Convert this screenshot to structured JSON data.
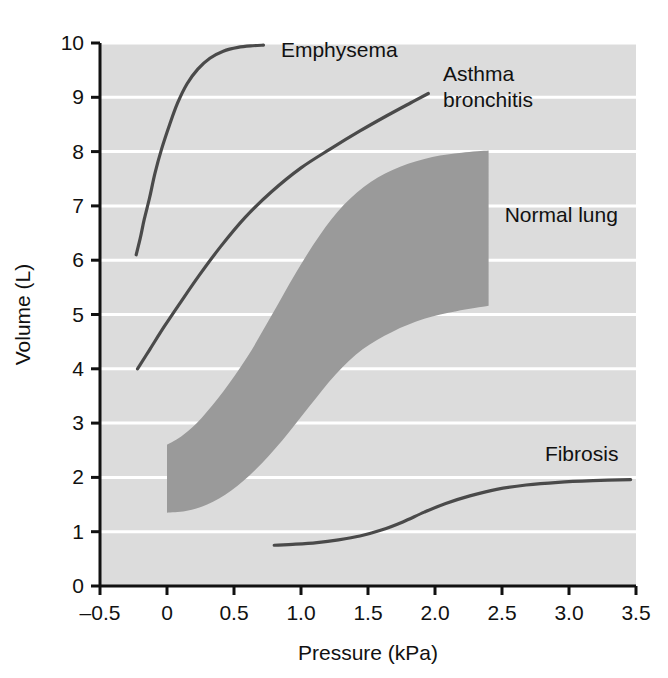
{
  "chart_data": {
    "type": "line",
    "title": "",
    "xlabel": "Pressure (kPa)",
    "ylabel": "Volume (L)",
    "xlim": [
      -0.5,
      3.5
    ],
    "ylim": [
      0,
      10
    ],
    "xticks": [
      "–0.5",
      "0",
      "0.5",
      "1.0",
      "1.5",
      "2.0",
      "2.5",
      "3.0",
      "3.5"
    ],
    "xtick_values": [
      -0.5,
      0,
      0.5,
      1.0,
      1.5,
      2.0,
      2.5,
      3.0,
      3.5
    ],
    "yticks": [
      "0",
      "1",
      "2",
      "3",
      "4",
      "5",
      "6",
      "7",
      "8",
      "9",
      "10"
    ],
    "ytick_values": [
      0,
      1,
      2,
      3,
      4,
      5,
      6,
      7,
      8,
      9,
      10
    ],
    "grid": "horizontal-white-gridlines",
    "legend": "inline-labels",
    "plot_background": "#dcdcdc",
    "gridline_color": "#ffffff",
    "curve_color": "#4a4a4a",
    "band_color": "#9a9a9a",
    "series": [
      {
        "name": "Emphysema",
        "label": "Emphysema",
        "type": "curve",
        "color": "#4a4a4a",
        "label_x": 0.85,
        "label_y": 9.75,
        "points": [
          [
            -0.23,
            6.1
          ],
          [
            -0.2,
            6.4
          ],
          [
            -0.17,
            6.75
          ],
          [
            -0.13,
            7.15
          ],
          [
            -0.09,
            7.6
          ],
          [
            -0.04,
            8.05
          ],
          [
            0.02,
            8.5
          ],
          [
            0.08,
            8.9
          ],
          [
            0.15,
            9.25
          ],
          [
            0.23,
            9.52
          ],
          [
            0.32,
            9.72
          ],
          [
            0.42,
            9.85
          ],
          [
            0.53,
            9.92
          ],
          [
            0.64,
            9.95
          ],
          [
            0.72,
            9.96
          ]
        ]
      },
      {
        "name": "Asthma bronchitis",
        "label_line1": "Asthma",
        "label_line2": "bronchitis",
        "type": "curve",
        "color": "#4a4a4a",
        "label_x": 2.06,
        "label_y": 9.3,
        "points": [
          [
            -0.22,
            4.0
          ],
          [
            -0.13,
            4.35
          ],
          [
            -0.02,
            4.78
          ],
          [
            0.1,
            5.22
          ],
          [
            0.24,
            5.72
          ],
          [
            0.4,
            6.25
          ],
          [
            0.58,
            6.78
          ],
          [
            0.78,
            7.26
          ],
          [
            1.0,
            7.7
          ],
          [
            1.22,
            8.05
          ],
          [
            1.44,
            8.38
          ],
          [
            1.64,
            8.66
          ],
          [
            1.82,
            8.9
          ],
          [
            1.95,
            9.07
          ]
        ]
      },
      {
        "name": "Normal lung",
        "label": "Normal lung",
        "type": "band",
        "color": "#9a9a9a",
        "label_x": 2.52,
        "label_y": 6.7,
        "upper": [
          [
            0.0,
            2.6
          ],
          [
            0.12,
            2.78
          ],
          [
            0.26,
            3.1
          ],
          [
            0.42,
            3.58
          ],
          [
            0.6,
            4.22
          ],
          [
            0.78,
            4.98
          ],
          [
            0.96,
            5.76
          ],
          [
            1.14,
            6.46
          ],
          [
            1.32,
            7.02
          ],
          [
            1.52,
            7.44
          ],
          [
            1.74,
            7.72
          ],
          [
            1.98,
            7.9
          ],
          [
            2.2,
            7.98
          ],
          [
            2.4,
            8.02
          ]
        ],
        "lower": [
          [
            0.0,
            1.35
          ],
          [
            0.14,
            1.38
          ],
          [
            0.3,
            1.5
          ],
          [
            0.48,
            1.76
          ],
          [
            0.66,
            2.14
          ],
          [
            0.86,
            2.68
          ],
          [
            1.06,
            3.3
          ],
          [
            1.26,
            3.9
          ],
          [
            1.46,
            4.36
          ],
          [
            1.68,
            4.68
          ],
          [
            1.92,
            4.92
          ],
          [
            2.16,
            5.06
          ],
          [
            2.4,
            5.16
          ]
        ]
      },
      {
        "name": "Fibrosis",
        "label": "Fibrosis",
        "type": "curve",
        "color": "#4a4a4a",
        "label_x": 2.82,
        "label_y": 2.3,
        "points": [
          [
            0.8,
            0.75
          ],
          [
            0.96,
            0.77
          ],
          [
            1.12,
            0.8
          ],
          [
            1.28,
            0.85
          ],
          [
            1.44,
            0.92
          ],
          [
            1.6,
            1.03
          ],
          [
            1.76,
            1.18
          ],
          [
            1.92,
            1.36
          ],
          [
            2.08,
            1.52
          ],
          [
            2.26,
            1.66
          ],
          [
            2.46,
            1.78
          ],
          [
            2.68,
            1.86
          ],
          [
            2.92,
            1.91
          ],
          [
            3.18,
            1.94
          ],
          [
            3.46,
            1.96
          ]
        ]
      }
    ]
  }
}
